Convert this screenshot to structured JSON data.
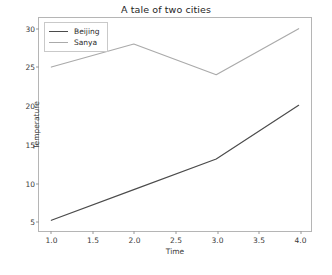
{
  "figure": {
    "title": "A tale of two cities",
    "caption": ""
  },
  "legend": {
    "position": "upper-left",
    "entries": [
      {
        "label": "Beijing",
        "color": "#4b4b4b"
      },
      {
        "label": "Sanya",
        "color": "#aaaaaa"
      }
    ]
  },
  "axes": {
    "xlabel": "Time",
    "ylabel": "Temperature",
    "xticks": [
      "1.0",
      "1.5",
      "2.0",
      "2.5",
      "3.0",
      "3.5",
      "4.0"
    ],
    "yticks": [
      "5",
      "10",
      "15",
      "20",
      "25",
      "30"
    ],
    "xlim": [
      0.85,
      4.15
    ],
    "ylim": [
      3.6,
      31.4
    ],
    "grid": false
  },
  "chart_data": {
    "type": "line",
    "title": "A tale of two cities",
    "xlabel": "Time",
    "ylabel": "Temperature",
    "x": [
      1,
      2,
      3,
      4
    ],
    "series": [
      {
        "name": "Beijing",
        "values": [
          5,
          9,
          13,
          20
        ],
        "color": "#4b4b4b"
      },
      {
        "name": "Sanya",
        "values": [
          25,
          28,
          24,
          30
        ],
        "color": "#aaaaaa"
      }
    ],
    "xticks": [
      1.0,
      1.5,
      2.0,
      2.5,
      3.0,
      3.5,
      4.0
    ],
    "yticks": [
      5,
      10,
      15,
      20,
      25,
      30
    ],
    "xlim": [
      0.85,
      4.15
    ],
    "ylim": [
      3.6,
      31.4
    ],
    "grid": false,
    "legend_position": "upper left"
  }
}
